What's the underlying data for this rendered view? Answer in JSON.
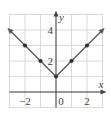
{
  "chart_data": {
    "type": "line",
    "title": "",
    "function": "y = |x| + 1",
    "xlabel": "x",
    "ylabel": "y",
    "xlim": [
      -3,
      3
    ],
    "ylim": [
      -1,
      5
    ],
    "grid": true,
    "x_tick_labels": [
      {
        "value": -2,
        "label": "−2"
      },
      {
        "value": 0,
        "label": "0"
      },
      {
        "value": 2,
        "label": "2"
      }
    ],
    "y_tick_labels": [
      {
        "value": 2,
        "label": "2"
      },
      {
        "value": 4,
        "label": "4"
      }
    ],
    "series": [
      {
        "name": "y = |x| + 1",
        "x": [
          -3,
          -2,
          -1,
          0,
          1,
          2,
          3
        ],
        "y": [
          4,
          3,
          2,
          1,
          2,
          3,
          4
        ],
        "marked_points": [
          [
            -2,
            3
          ],
          [
            -1,
            2
          ],
          [
            0,
            1
          ],
          [
            1,
            2
          ],
          [
            2,
            3
          ]
        ],
        "arrows_at_ends": true
      }
    ],
    "colors": {
      "line": "#555555",
      "grid": "#cccccc",
      "axis": "#444444"
    }
  }
}
